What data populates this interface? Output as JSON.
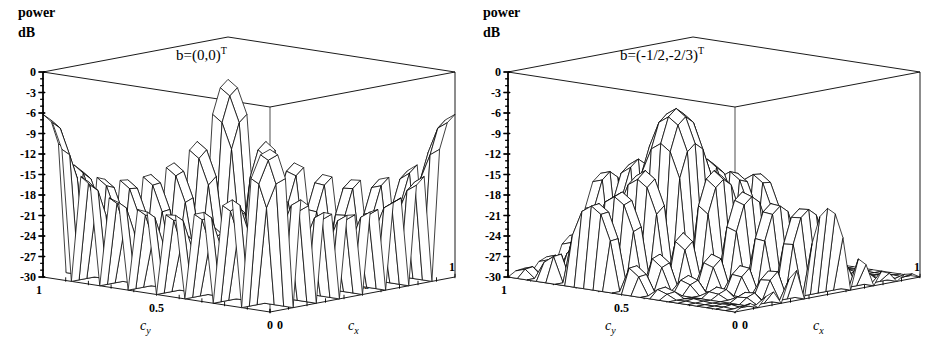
{
  "figure": {
    "kind": "two 3D wireframe surface plots of array beampattern power",
    "background": "#ffffff",
    "line_color": "#000000"
  },
  "panels": [
    {
      "id": "left",
      "title": "b=(0,0)",
      "title_sup": "T",
      "axis_label_line1": "power",
      "axis_label_line2": "dB",
      "z_ticks": [
        "0",
        "-3",
        "-6",
        "-9",
        "-12",
        "-15",
        "-18",
        "-21",
        "-24",
        "-27",
        "-30"
      ],
      "cy_axis_name": "c",
      "cy_axis_sub": "y",
      "cy_ticks": [
        "1",
        "0.5",
        "0"
      ],
      "cx_axis_name": "c",
      "cx_axis_sub": "x",
      "cx_ticks": [
        "0",
        "0.5",
        "1"
      ]
    },
    {
      "id": "right",
      "title": "b=(-1/2,-2/3)",
      "title_sup": "T",
      "axis_label_line1": "power",
      "axis_label_line2": "dB",
      "z_ticks": [
        "0",
        "-3",
        "-6",
        "-9",
        "-12",
        "-15",
        "-18",
        "-21",
        "-24",
        "-27",
        "-30"
      ],
      "cy_axis_name": "c",
      "cy_axis_sub": "y",
      "cy_ticks": [
        "1",
        "0.5",
        "0"
      ],
      "cx_axis_name": "c",
      "cx_axis_sub": "x",
      "cx_ticks": [
        "0",
        "0.5",
        "1"
      ]
    }
  ],
  "chart_data": {
    "type": "surface",
    "xlabel": "c_x",
    "ylabel": "c_y",
    "zlabel": "power dB",
    "xlim": [
      0,
      1
    ],
    "ylim": [
      0,
      1
    ],
    "zlim": [
      -30,
      0
    ],
    "x_ticks": [
      0,
      0.5,
      1
    ],
    "y_ticks": [
      1,
      0.5,
      0
    ],
    "z_ticks": [
      0,
      -3,
      -6,
      -9,
      -12,
      -15,
      -18,
      -21,
      -24,
      -27,
      -30
    ],
    "z_tick_step": 3,
    "minor_tick_count_per_axis": 10,
    "grid": false,
    "legend": false,
    "mesh_divisions": 24,
    "surfaces": [
      {
        "name": "b=(0,0)^T",
        "panel": "left",
        "description": "Single broad main lobe; dome peaking near -7 dB at the far corner, falling steeply to a single deep null column at c_x=0, c_y=0 reaching below -30 dB.",
        "beam_offset": [
          0,
          0
        ],
        "peak_db": -7,
        "floor_db": -30,
        "null_locations": [
          [
            0,
            0
          ]
        ],
        "null_count": 1
      },
      {
        "name": "b=(-1/2,-2/3)^T",
        "panel": "right",
        "description": "Multi-lobe grating pattern; plateau around -9 to -12 dB broken by a regular grid of deep nulls reaching below -30 dB.",
        "beam_offset": [
          -0.5,
          -0.6667
        ],
        "peak_db": -6,
        "floor_db": -30,
        "null_locations": [
          [
            0.0,
            0.0
          ],
          [
            0.5,
            0.0
          ],
          [
            1.0,
            0.0
          ],
          [
            0.0,
            0.5
          ],
          [
            0.5,
            0.5
          ],
          [
            1.0,
            0.5
          ],
          [
            0.0,
            1.0
          ],
          [
            0.5,
            1.0
          ],
          [
            1.0,
            1.0
          ]
        ],
        "null_count": 9
      }
    ]
  }
}
